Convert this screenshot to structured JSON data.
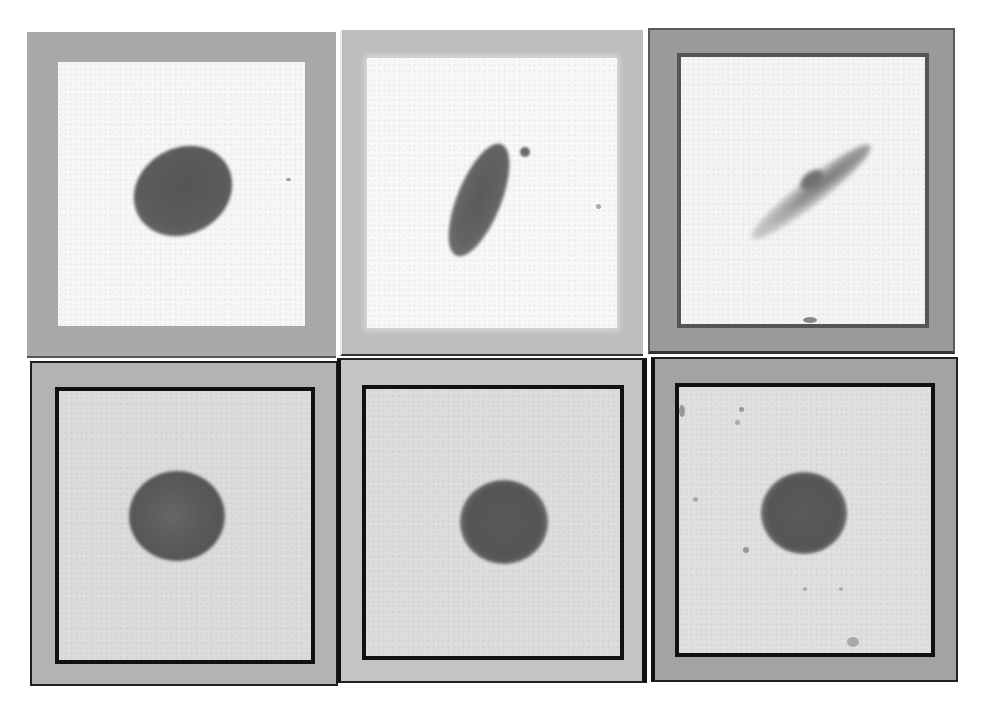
{
  "figure": {
    "layout": {
      "rows": 2,
      "columns": 3
    },
    "panels": [
      {
        "id": "top-left",
        "row": 1,
        "col": 1,
        "frame_color": "#a9a9a9",
        "inner_color": "#f7f7f7",
        "inner_border": "none",
        "object": "dark oval blob, tilted",
        "blob_color": "#5c5c5c"
      },
      {
        "id": "top-middle",
        "row": 1,
        "col": 2,
        "frame_color": "#bdbdbd",
        "inner_color": "#f8f8f8",
        "inner_border": "none",
        "object": "elongated diagonal blob",
        "blob_color": "#666666"
      },
      {
        "id": "top-right",
        "row": 1,
        "col": 3,
        "frame_color": "#9a9a9a",
        "inner_color": "#f4f4f4",
        "inner_border": "dark",
        "object": "faint diffuse streak",
        "blob_color": "#8a8a8a"
      },
      {
        "id": "bottom-left",
        "row": 2,
        "col": 1,
        "frame_color": "#b3b3b3",
        "inner_color": "#dcdcdc",
        "inner_border": "black",
        "object": "round dark spot",
        "blob_color": "#555555"
      },
      {
        "id": "bottom-middle",
        "row": 2,
        "col": 2,
        "frame_color": "#c4c4c4",
        "inner_color": "#dddddd",
        "inner_border": "black",
        "object": "round dark spot",
        "blob_color": "#555555"
      },
      {
        "id": "bottom-right",
        "row": 2,
        "col": 3,
        "frame_color": "#a3a3a3",
        "inner_color": "#e0e0e0",
        "inner_border": "black",
        "object": "round dark spot",
        "blob_color": "#555555"
      }
    ]
  }
}
